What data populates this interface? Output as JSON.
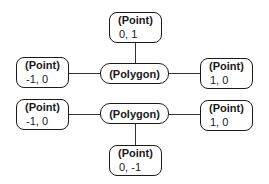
{
  "diagrams": [
    {
      "polygon": {
        "label": "(Polygon)"
      },
      "points": [
        {
          "label": "(Point)",
          "coords": "0, 1",
          "position": "top"
        },
        {
          "label": "(Point)",
          "coords": "-1, 0",
          "position": "left"
        },
        {
          "label": "(Point)",
          "coords": "1, 0",
          "position": "right"
        }
      ]
    },
    {
      "polygon": {
        "label": "(Polygon)"
      },
      "points": [
        {
          "label": "(Point)",
          "coords": "-1, 0",
          "position": "left"
        },
        {
          "label": "(Point)",
          "coords": "1, 0",
          "position": "right"
        },
        {
          "label": "(Point)",
          "coords": "0, -1",
          "position": "bottom"
        }
      ]
    }
  ]
}
